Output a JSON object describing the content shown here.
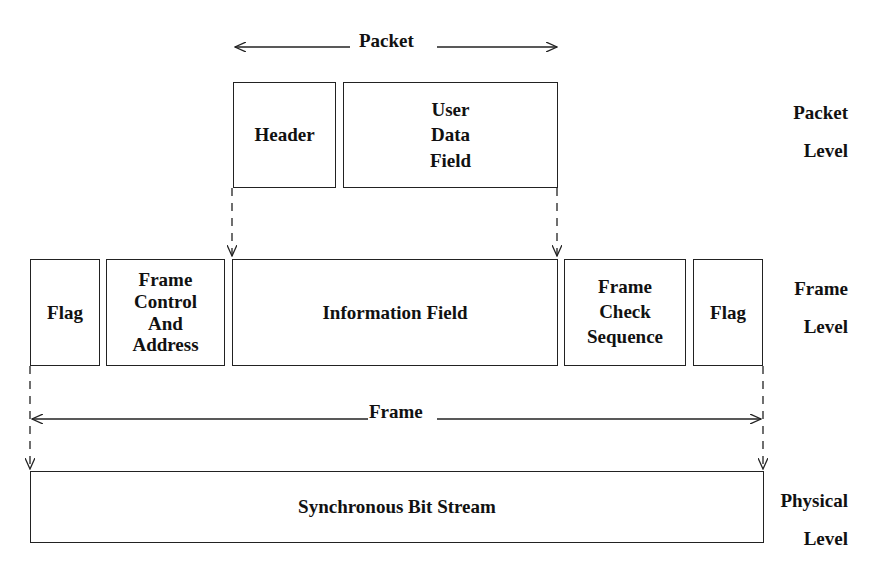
{
  "diagram": {
    "packet_span_label": "Packet",
    "frame_span_label": "Frame",
    "packet_level": {
      "label": "Packet\nLevel",
      "boxes": [
        {
          "id": "header",
          "label": "Header"
        },
        {
          "id": "user-data-field",
          "label": "User\nData\nField"
        }
      ]
    },
    "frame_level": {
      "label": "Frame\nLevel",
      "boxes": [
        {
          "id": "flag-start",
          "label": "Flag"
        },
        {
          "id": "frame-control-address",
          "label": "Frame\nControl\nAnd\nAddress"
        },
        {
          "id": "information-field",
          "label": "Information Field"
        },
        {
          "id": "frame-check-sequence",
          "label": "Frame\nCheck\nSequence"
        },
        {
          "id": "flag-end",
          "label": "Flag"
        }
      ]
    },
    "physical_level": {
      "label": "Physical\nLevel",
      "boxes": [
        {
          "id": "synchronous-bit-stream",
          "label": "Synchronous Bit Stream"
        }
      ]
    }
  }
}
